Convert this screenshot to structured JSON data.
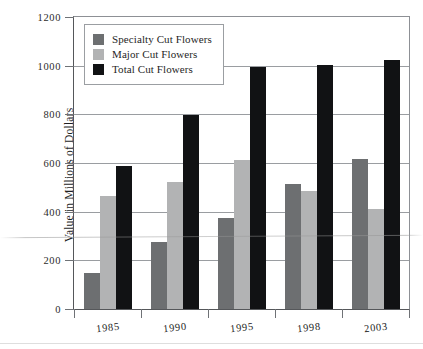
{
  "chart_data": {
    "type": "bar",
    "title": "",
    "xlabel": "",
    "ylabel": "Value in Millions of Dollars",
    "categories": [
      "1985",
      "1990",
      "1995",
      "1998",
      "2003"
    ],
    "series": [
      {
        "name": "Specialty Cut Flowers",
        "color": "#6d6f71",
        "values": [
          150,
          275,
          375,
          515,
          615
        ]
      },
      {
        "name": "Major Cut Flowers",
        "color": "#b2b3b4",
        "values": [
          465,
          520,
          612,
          485,
          410
        ]
      },
      {
        "name": "Total Cut Flowers",
        "color": "#111214",
        "values": [
          588,
          798,
          995,
          1002,
          1025
        ]
      }
    ],
    "ylim": [
      0,
      1200
    ],
    "yticks": [
      0,
      200,
      400,
      600,
      800,
      1000,
      1200
    ],
    "ytick_labels": [
      "0",
      "200",
      "400",
      "600",
      "800",
      "1000",
      "1200"
    ],
    "grid": true,
    "legend_position": "top-left"
  },
  "legend": {
    "items": [
      {
        "label": "Specialty Cut Flowers",
        "swatch": "specialty"
      },
      {
        "label": "Major Cut Flowers",
        "swatch": "major"
      },
      {
        "label": "Total Cut Flowers",
        "swatch": "total"
      }
    ]
  },
  "colors": {
    "specialty": "#6d6f71",
    "major": "#b2b3b4",
    "total": "#111214",
    "axis": "#55575a",
    "grid": "#9a9da1",
    "background": "#ffffff"
  }
}
